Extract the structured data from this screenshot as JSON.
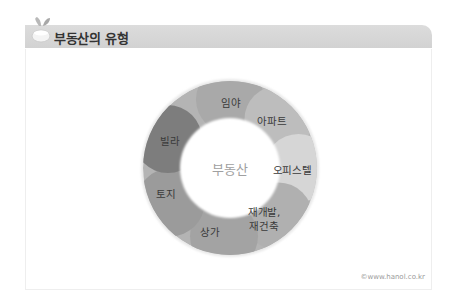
{
  "header": {
    "title": "부동산의 유형",
    "icon": "sprout-bowl-icon"
  },
  "diagram": {
    "type": "donut-ring",
    "center_label": "부동산",
    "center": [
      230,
      168
    ],
    "outer_radius": 87,
    "inner_radius": 50,
    "segments": [
      {
        "label": "임야",
        "color": "#a9a9a9",
        "pos": [
          231,
          103
        ]
      },
      {
        "label": "아파트",
        "color": "#bdbdbd",
        "pos": [
          272,
          121
        ]
      },
      {
        "label": "오피스텔",
        "color": "#d6d6d6",
        "pos": [
          292,
          170
        ]
      },
      {
        "label": "재개발,\n재건축",
        "color": "#b0b0b0",
        "pos": [
          264,
          219
        ]
      },
      {
        "label": "상가",
        "color": "#a3a3a3",
        "pos": [
          210,
          232
        ]
      },
      {
        "label": "토지",
        "color": "#9b9b9b",
        "pos": [
          166,
          194
        ]
      },
      {
        "label": "빌라",
        "color": "#7d7d7d",
        "pos": [
          170,
          141
        ]
      }
    ]
  },
  "footer": {
    "copyright": "©www.hanol.co.kr"
  }
}
